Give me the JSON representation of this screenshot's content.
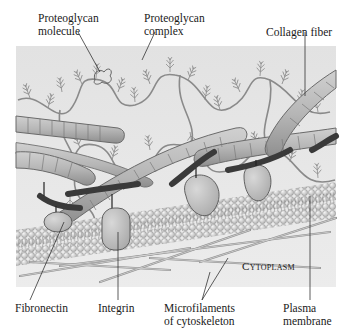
{
  "diagram": {
    "colors": {
      "background": "#ffffff",
      "panel": "#e4e4e4",
      "collagen_fill": "#b8b8b8",
      "collagen_stroke": "#6a6a6a",
      "fibronectin": "#4a4a4a",
      "integrin": "#c4c4c4",
      "proteoglycan": "#8a8a8a",
      "phospholipid_head": "#d6d6d6",
      "microfilament": "#a8a8a8",
      "leader_line": "#333333"
    },
    "labels": {
      "proteoglycan_molecule": [
        "Proteoglycan",
        "molecule"
      ],
      "proteoglycan_complex": [
        "Proteoglycan",
        "complex"
      ],
      "collagen_fiber": "Collagen fiber",
      "fibronectin": "Fibronectin",
      "integrin": "Integrin",
      "microfilaments": [
        "Microfilaments",
        "of cytoskeleton"
      ],
      "plasma_membrane": [
        "Plasma",
        "membrane"
      ],
      "cytoplasm": "Cytoplasm"
    }
  }
}
